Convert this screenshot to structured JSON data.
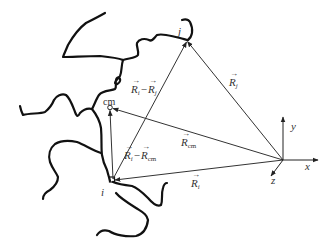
{
  "diagram": {
    "colors": {
      "chain": "#111111",
      "vector": "#333333",
      "text": "#333333",
      "background": "#ffffff"
    },
    "points": {
      "origin": {
        "x": 283,
        "y": 160
      },
      "j": {
        "label": "j",
        "x": 186,
        "y": 40
      },
      "cm": {
        "label": "cm",
        "x": 110,
        "y": 108
      },
      "i": {
        "label": "i",
        "x": 113,
        "y": 180
      }
    },
    "axes": {
      "x": {
        "label": "x"
      },
      "y": {
        "label": "y"
      },
      "z": {
        "label": "z"
      }
    },
    "vectors": [
      {
        "id": "Ri",
        "label_base": "R",
        "label_sub": "i",
        "from": "origin",
        "to": "i"
      },
      {
        "id": "Rj",
        "label_base": "R",
        "label_sub": "j",
        "from": "origin",
        "to": "j"
      },
      {
        "id": "Rcm",
        "label_base": "R",
        "label_sub": "cm",
        "from": "origin",
        "to": "cm"
      },
      {
        "id": "Ri-Rj",
        "label_a_base": "R",
        "label_a_sub": "i",
        "minus": "−",
        "label_b_base": "R",
        "label_b_sub": "j",
        "from": "i",
        "to": "j"
      },
      {
        "id": "Ri-Rcm",
        "label_a_base": "R",
        "label_a_sub": "i",
        "minus": "−",
        "label_b_base": "R",
        "label_b_sub": "cm",
        "from": "i",
        "to": "cm"
      }
    ]
  }
}
